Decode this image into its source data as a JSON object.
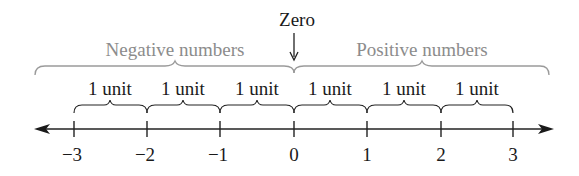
{
  "diagram": {
    "title_label": "Zero",
    "group_labels": {
      "negative": "Negative numbers",
      "positive": "Positive numbers"
    },
    "unit_labels": [
      "1 unit",
      "1 unit",
      "1 unit",
      "1 unit",
      "1 unit",
      "1 unit"
    ],
    "ticks": [
      {
        "value": -3,
        "label": "−3"
      },
      {
        "value": -2,
        "label": "−2"
      },
      {
        "value": -1,
        "label": "−1"
      },
      {
        "value": 0,
        "label": "0"
      },
      {
        "value": 1,
        "label": "1"
      },
      {
        "value": 2,
        "label": "2"
      },
      {
        "value": 3,
        "label": "3"
      }
    ],
    "colors": {
      "ink": "#1a1a1a",
      "muted": "#8c8c8c"
    }
  }
}
